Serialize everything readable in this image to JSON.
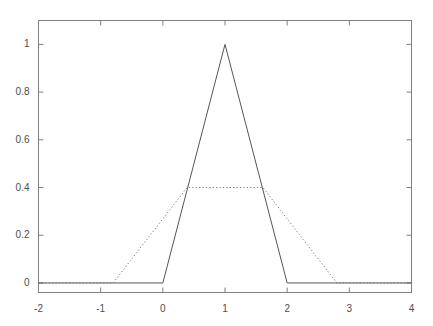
{
  "chart_data": {
    "type": "line",
    "title": "",
    "xlabel": "",
    "ylabel": "",
    "xlim": [
      -2,
      4
    ],
    "ylim": [
      -0.04,
      1.1
    ],
    "grid": false,
    "legend": null,
    "x_ticks": [
      -2,
      -1,
      0,
      1,
      2,
      3,
      4
    ],
    "x_tick_labels": [
      "-2",
      "-1",
      "0",
      "1",
      "2",
      "3",
      "4"
    ],
    "y_ticks": [
      0,
      0.2,
      0.4,
      0.6,
      0.8,
      1
    ],
    "y_tick_labels": [
      "0",
      "0.2",
      "0.4",
      "0.6",
      "0.8",
      "1"
    ],
    "series": [
      {
        "name": "triangular",
        "style": "solid",
        "color": "#555555",
        "x": [
          -2,
          0,
          1,
          2,
          4
        ],
        "values": [
          0,
          0,
          1,
          0,
          0
        ]
      },
      {
        "name": "trapezoidal",
        "style": "dotted",
        "color": "#777777",
        "x": [
          -2,
          -0.8,
          0.39,
          1.61,
          2.8,
          4
        ],
        "values": [
          0,
          0,
          0.4,
          0.4,
          0,
          0
        ]
      }
    ]
  },
  "axes": {
    "frame_color": "#808080",
    "tick_color": "#808080",
    "background": "#ffffff"
  }
}
